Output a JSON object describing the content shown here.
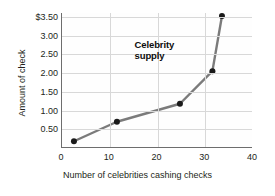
{
  "chart_data": {
    "type": "line",
    "title": "",
    "xlabel": "Number of celebrities cashing checks",
    "ylabel": "Amount of check",
    "xlim": [
      0,
      40
    ],
    "ylim": [
      0,
      3.6
    ],
    "grid": true,
    "legend": "none",
    "series": [
      {
        "name": "Celebrity supply",
        "x": [
          2.5,
          11.5,
          24.7,
          31.5,
          33.5
        ],
        "values": [
          0.18,
          0.7,
          1.18,
          2.05,
          3.52
        ],
        "color": "#7b7b7b",
        "marker": "circle",
        "marker_color": "#1a1a1a"
      }
    ],
    "xticks": [
      {
        "value": 0,
        "label": "0"
      },
      {
        "value": 10,
        "label": "10"
      },
      {
        "value": 20,
        "label": "20"
      },
      {
        "value": 30,
        "label": "30"
      },
      {
        "value": 40,
        "label": "40"
      }
    ],
    "yticks": [
      {
        "value": 3.5,
        "label": "$3.50"
      },
      {
        "value": 3.0,
        "label": "3.00"
      },
      {
        "value": 2.5,
        "label": "2.50"
      },
      {
        "value": 2.0,
        "label": "2.00"
      },
      {
        "value": 1.5,
        "label": "1.50"
      },
      {
        "value": 1.0,
        "label": "1.00"
      },
      {
        "value": 0.5,
        "label": "0.50"
      }
    ],
    "annotations": [
      {
        "text": "Celebrity\nsupply",
        "x": 20,
        "y": 2.75
      }
    ]
  },
  "colors": {
    "line": "#7b7b7b",
    "marker": "#1a1a1a",
    "grid": "#d8d8d8",
    "axis": "#6d6d6d",
    "text": "#231f20",
    "background": "#ffffff"
  }
}
